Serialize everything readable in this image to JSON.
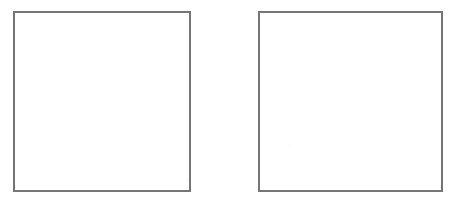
{
  "page": {
    "background_color": "#ffffff",
    "width": 458,
    "height": 205,
    "kind": "scanned-figure"
  },
  "figure": {
    "stroke_color": "#767676",
    "fill_color": "#ffffff",
    "boxes": [
      {
        "name": "left-box",
        "label": "",
        "content": "",
        "x": 13,
        "y": 11,
        "width": 178,
        "height": 181
      },
      {
        "name": "right-box",
        "label": "",
        "content": "",
        "x": 258,
        "y": 11,
        "width": 185,
        "height": 181
      }
    ]
  }
}
